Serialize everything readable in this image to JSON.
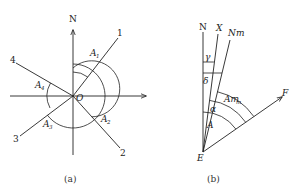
{
  "panel_a": {
    "caption": "(a)",
    "axis_north": "N",
    "axis_east": "E",
    "origin": "O",
    "lines": [
      {
        "id": "1",
        "label": "1"
      },
      {
        "id": "2",
        "label": "2"
      },
      {
        "id": "3",
        "label": "3"
      },
      {
        "id": "4",
        "label": "4"
      }
    ],
    "angles": [
      {
        "base": "A",
        "sub": "1"
      },
      {
        "base": "A",
        "sub": "2"
      },
      {
        "base": "A",
        "sub": "3"
      },
      {
        "base": "A",
        "sub": "4"
      }
    ]
  },
  "panel_b": {
    "caption": "(b)",
    "point": "E",
    "north": "N",
    "grid_north": "X",
    "magnetic_north": "Nm",
    "target": "F",
    "gamma": "γ",
    "delta": "δ",
    "alpha": "α",
    "azimuth": "A",
    "magnetic_azimuth": {
      "base": "Am",
      "sub": "m"
    }
  }
}
